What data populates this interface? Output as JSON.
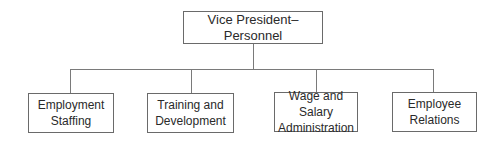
{
  "diagram": {
    "type": "org-chart",
    "root": {
      "label": "Vice President–Personnel"
    },
    "children": [
      {
        "label": "Employment\nStaffing"
      },
      {
        "label": "Training and\nDevelopment"
      },
      {
        "label": "Wage and Salary\nAdministration"
      },
      {
        "label": "Employee\nRelations"
      }
    ],
    "colors": {
      "line": "#7a7a7a",
      "border": "#6a6a6a",
      "text": "#2a2a2a",
      "background": "#ffffff"
    }
  }
}
